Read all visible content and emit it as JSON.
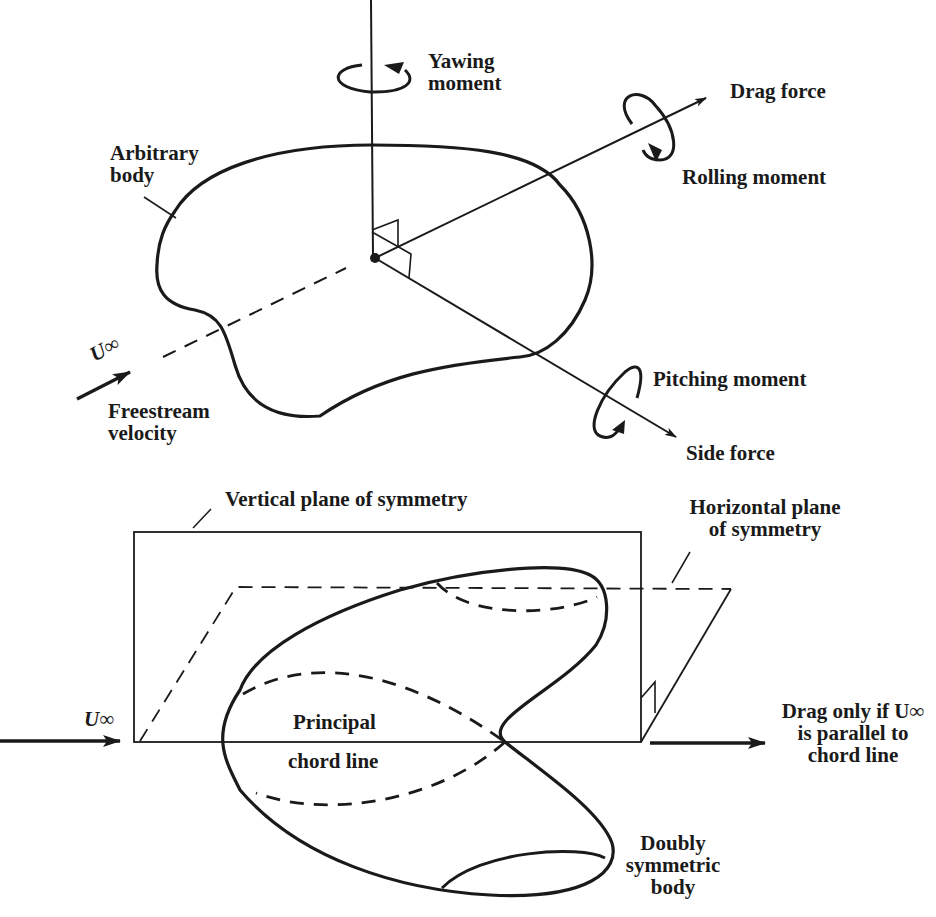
{
  "diagram": {
    "top": {
      "yawing_moment": [
        "Yawing",
        "moment"
      ],
      "drag_force": "Drag force",
      "rolling_moment": "Rolling moment",
      "arbitrary_body": [
        "Arbitrary",
        "body"
      ],
      "freestream_symbol": "U∞",
      "freestream_velocity": [
        "Freestream",
        "velocity"
      ],
      "pitching_moment": "Pitching moment",
      "side_force": "Side force"
    },
    "bottom": {
      "vertical_plane": "Vertical plane of symmetry",
      "horizontal_plane": [
        "Horizontal plane",
        "of symmetry"
      ],
      "freestream_symbol": "U∞",
      "principal": "Principal",
      "chord_line": "chord line",
      "drag_note": [
        "Drag only if U∞",
        "is parallel to",
        "chord line"
      ],
      "doubly_symmetric_body": [
        "Doubly",
        "symmetric",
        "body"
      ]
    },
    "colors": {
      "ink": "#1a1a1a",
      "background": "#ffffff"
    }
  }
}
